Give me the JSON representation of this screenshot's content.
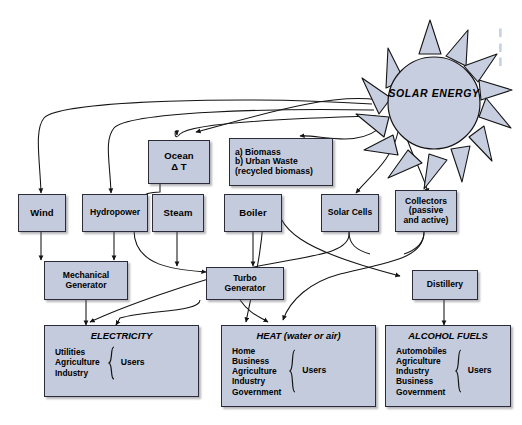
{
  "diagram": {
    "source": {
      "label": "SOLAR ENERGY",
      "line1": "SOLAR",
      "line2": "ENERGY"
    },
    "colors": {
      "box_fill": "#c3cbdd",
      "box_stroke": "#2b2b3a",
      "background": "#ffffff",
      "line": "#1a1a1a"
    },
    "nodes": [
      {
        "id": "ocean",
        "label": "Ocean\nΔ T",
        "line1": "Ocean",
        "line2": "Δ T"
      },
      {
        "id": "biomass",
        "line1": "a) Biomass",
        "line2": "b) Urban Waste",
        "line3": "(recycled biomass)"
      },
      {
        "id": "wind",
        "label": "Wind"
      },
      {
        "id": "hydropower",
        "label": "Hydropower"
      },
      {
        "id": "steam",
        "label": "Steam"
      },
      {
        "id": "boiler",
        "label": "Boiler"
      },
      {
        "id": "solarcells",
        "label": "Solar Cells"
      },
      {
        "id": "collectors",
        "line1": "Collectors",
        "line2": "(passive",
        "line3": "and active)"
      },
      {
        "id": "mechgen",
        "line1": "Mechanical",
        "line2": "Generator"
      },
      {
        "id": "turbogen",
        "line1": "Turbo",
        "line2": "Generator"
      },
      {
        "id": "distillery",
        "label": "Distillery"
      }
    ],
    "sinks": [
      {
        "id": "electricity",
        "title": "ELECTRICITY",
        "items": [
          "Utilities",
          "Agriculture",
          "Industry"
        ],
        "users": "Users"
      },
      {
        "id": "heat",
        "title": "HEAT (water or air)",
        "items": [
          "Home",
          "Business",
          "Agriculture",
          "Industry",
          "Government"
        ],
        "users": "Users"
      },
      {
        "id": "alcohol",
        "title": "ALCOHOL FUELS",
        "items": [
          "Automobiles",
          "Agriculture",
          "Industry",
          "Business",
          "Government"
        ],
        "users": "Users"
      }
    ],
    "margin_text": {
      "l1": "▌",
      "l2": "▌",
      "l3": "▌"
    }
  }
}
